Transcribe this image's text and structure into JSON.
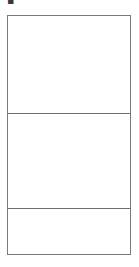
{
  "page": {
    "background_color": "#ffffff",
    "width": 139,
    "height": 267
  },
  "top_marker": {
    "glyph": "▪",
    "name": "clipped-glyph",
    "color": "#3a3a3a"
  },
  "table": {
    "border_color": "#7a7a7a",
    "rule_color": "#6e6e6e",
    "background_color": "#ffffff",
    "row_count": 3,
    "column_count": 1,
    "rows": [
      {
        "text": ""
      },
      {
        "text": ""
      },
      {
        "text": ""
      }
    ]
  }
}
